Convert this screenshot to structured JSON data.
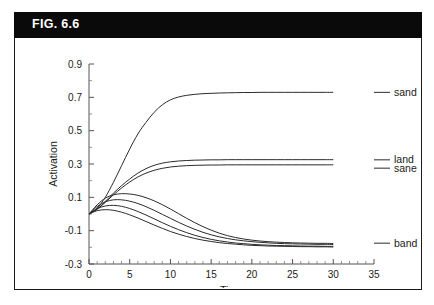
{
  "figure": {
    "banner_label": "FIG. 6.6",
    "banner_bg": "#0a0a0a",
    "banner_fg": "#ffffff",
    "border_color": "#1a1a1a"
  },
  "chart_data": {
    "type": "line",
    "title": "",
    "xlabel": "Time",
    "ylabel": "Activation",
    "xlim": [
      0,
      35
    ],
    "ylim": [
      -0.3,
      0.9
    ],
    "x_ticks": [
      0,
      5,
      10,
      15,
      20,
      25,
      30,
      35
    ],
    "x_tick_labels": [
      "0",
      "5",
      "10",
      "15",
      "20",
      "25",
      "30",
      "35"
    ],
    "x_minor_step": 1,
    "y_ticks": [
      -0.3,
      -0.1,
      0.1,
      0.3,
      0.5,
      0.7,
      0.9
    ],
    "y_tick_labels": [
      "-0.3",
      "-0.1",
      "0.1",
      "0.3",
      "0.5",
      "0.7",
      "0.9"
    ],
    "y_minor_step": 0.1,
    "grid": false,
    "legend_position": "right-inline-labels",
    "line_color": "#2b2b2b",
    "x": [
      0,
      1,
      2,
      3,
      4,
      5,
      6,
      7,
      8,
      9,
      10,
      11,
      12,
      13,
      14,
      15,
      16,
      17,
      18,
      19,
      20,
      21,
      22,
      23,
      24,
      25,
      26,
      27,
      28,
      29,
      30
    ],
    "series": [
      {
        "name": "sand",
        "label": "sand",
        "label_y": 0.73,
        "values": [
          0.0,
          0.035,
          0.1,
          0.19,
          0.29,
          0.39,
          0.48,
          0.55,
          0.61,
          0.655,
          0.685,
          0.702,
          0.712,
          0.718,
          0.722,
          0.724,
          0.726,
          0.727,
          0.728,
          0.729,
          0.729,
          0.73,
          0.73,
          0.73,
          0.73,
          0.73,
          0.73,
          0.73,
          0.73,
          0.73,
          0.73
        ]
      },
      {
        "name": "land",
        "label": "land",
        "label_y": 0.325,
        "values": [
          0.0,
          0.03,
          0.075,
          0.125,
          0.17,
          0.21,
          0.245,
          0.272,
          0.292,
          0.305,
          0.313,
          0.318,
          0.321,
          0.323,
          0.324,
          0.325,
          0.325,
          0.326,
          0.326,
          0.326,
          0.326,
          0.326,
          0.326,
          0.326,
          0.326,
          0.326,
          0.326,
          0.326,
          0.326,
          0.326,
          0.326
        ]
      },
      {
        "name": "sane",
        "label": "sane",
        "label_y": 0.275,
        "values": [
          0.0,
          0.028,
          0.07,
          0.115,
          0.156,
          0.192,
          0.222,
          0.245,
          0.262,
          0.274,
          0.282,
          0.287,
          0.29,
          0.292,
          0.293,
          0.294,
          0.294,
          0.295,
          0.295,
          0.295,
          0.295,
          0.295,
          0.295,
          0.295,
          0.295,
          0.295,
          0.295,
          0.295,
          0.295,
          0.295,
          0.295
        ]
      },
      {
        "name": "band",
        "label": "band",
        "label_y": -0.175,
        "values": [
          0.0,
          0.055,
          0.095,
          0.115,
          0.122,
          0.12,
          0.112,
          0.098,
          0.079,
          0.056,
          0.03,
          0.002,
          -0.026,
          -0.052,
          -0.076,
          -0.097,
          -0.115,
          -0.13,
          -0.141,
          -0.15,
          -0.157,
          -0.162,
          -0.166,
          -0.169,
          -0.171,
          -0.173,
          -0.174,
          -0.175,
          -0.176,
          -0.176,
          -0.177
        ]
      },
      {
        "name": "unlabeled-curve-1",
        "label": "",
        "label_y": null,
        "values": [
          0.0,
          0.045,
          0.073,
          0.085,
          0.085,
          0.077,
          0.063,
          0.044,
          0.022,
          -0.002,
          -0.026,
          -0.05,
          -0.072,
          -0.092,
          -0.11,
          -0.125,
          -0.137,
          -0.147,
          -0.155,
          -0.161,
          -0.166,
          -0.17,
          -0.173,
          -0.176,
          -0.178,
          -0.179,
          -0.18,
          -0.181,
          -0.182,
          -0.182,
          -0.183
        ]
      },
      {
        "name": "unlabeled-curve-2",
        "label": "",
        "label_y": null,
        "values": [
          0.0,
          0.032,
          0.048,
          0.052,
          0.046,
          0.033,
          0.015,
          -0.006,
          -0.029,
          -0.052,
          -0.074,
          -0.094,
          -0.112,
          -0.128,
          -0.141,
          -0.152,
          -0.161,
          -0.168,
          -0.174,
          -0.178,
          -0.182,
          -0.185,
          -0.187,
          -0.189,
          -0.19,
          -0.191,
          -0.192,
          -0.193,
          -0.193,
          -0.194,
          -0.194
        ]
      },
      {
        "name": "unlabeled-curve-3",
        "label": "",
        "label_y": null,
        "values": [
          0.0,
          0.02,
          0.026,
          0.022,
          0.011,
          -0.005,
          -0.024,
          -0.045,
          -0.066,
          -0.086,
          -0.105,
          -0.121,
          -0.135,
          -0.147,
          -0.157,
          -0.165,
          -0.172,
          -0.177,
          -0.181,
          -0.185,
          -0.188,
          -0.19,
          -0.192,
          -0.193,
          -0.194,
          -0.195,
          -0.196,
          -0.196,
          -0.197,
          -0.197,
          -0.198
        ]
      }
    ]
  }
}
